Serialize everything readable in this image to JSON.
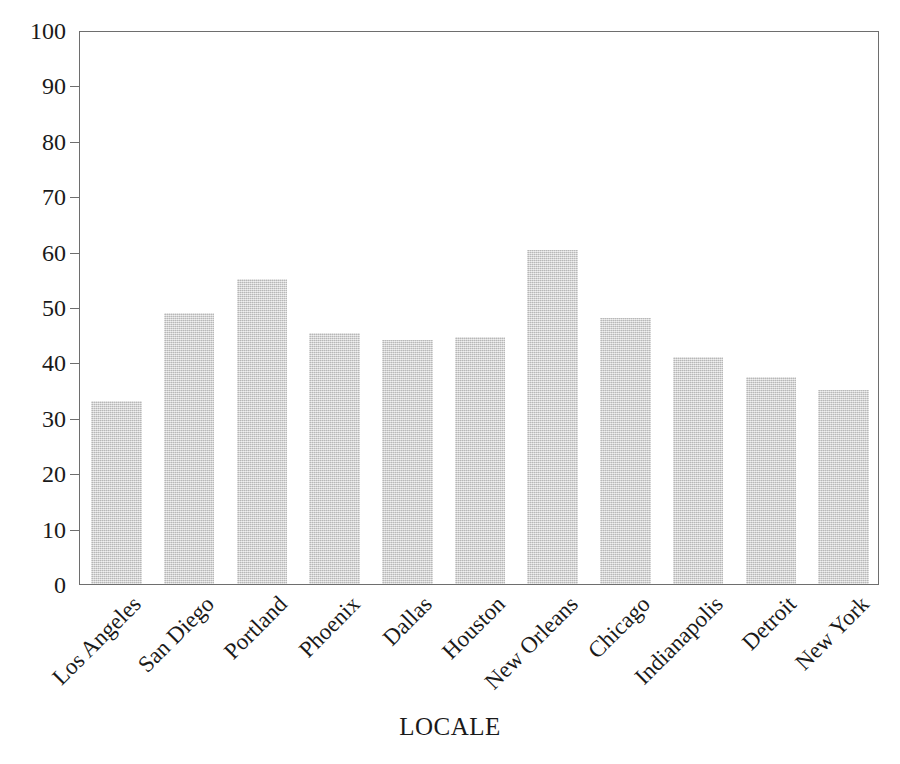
{
  "chart_data": {
    "type": "bar",
    "title": "",
    "xlabel": "LOCALE",
    "ylabel": "PERCENT",
    "categories": [
      "Los Angeles",
      "San Diego",
      "Portland",
      "Phoenix",
      "Dallas",
      "Houston",
      "New Orleans",
      "Chicago",
      "Indianapolis",
      "Detroit",
      "New York"
    ],
    "values": [
      33,
      49,
      55,
      45.3,
      44,
      44.5,
      60.3,
      48,
      41,
      37.3,
      35
    ],
    "ylim": [
      0,
      100
    ],
    "ytick_labels": [
      "0",
      "10",
      "20",
      "30",
      "40",
      "50",
      "60",
      "70",
      "80",
      "90",
      "100"
    ],
    "ytick_values": [
      0,
      10,
      20,
      30,
      40,
      50,
      60,
      70,
      80,
      90,
      100
    ],
    "grid": false,
    "legend": false,
    "bar_color": "#c9c9c9",
    "frame_color": "#6e6e6e",
    "text_color": "#1a1a1a"
  }
}
